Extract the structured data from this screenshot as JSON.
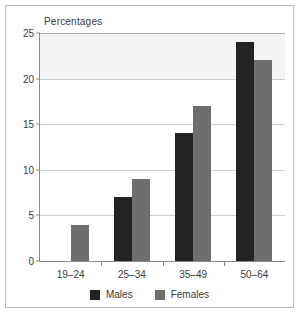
{
  "chart": {
    "title": "Percentages",
    "legend": [
      {
        "label": "Males",
        "color": "#232323",
        "swatch": "male-swatch"
      },
      {
        "label": "Females",
        "color": "#6e6e6e",
        "swatch": "female-swatch"
      }
    ]
  },
  "chart_data": {
    "type": "bar",
    "title": "Percentages",
    "xlabel": "",
    "ylabel": "Percentages",
    "categories": [
      "19–24",
      "25–34",
      "35–49",
      "50–64"
    ],
    "series": [
      {
        "name": "Males",
        "color": "#232323",
        "values": [
          null,
          7,
          14,
          24
        ]
      },
      {
        "name": "Femalesx",
        "color": "#6e6e6e",
        "values": [
          4,
          9,
          17,
          22
        ]
      }
    ],
    "ylim": [
      0,
      25
    ],
    "yticks": [
      0,
      5,
      10,
      15,
      20,
      25
    ],
    "ytick_labels": [
      "0",
      "5",
      "10",
      "15",
      "20",
      "25"
    ],
    "grid": true,
    "legend_position": "bottom",
    "shaded_band": {
      "from": 20,
      "to": 25,
      "color": "#f4f4f6"
    },
    "note": "No Males bar is drawn for the 19–24 age group"
  }
}
